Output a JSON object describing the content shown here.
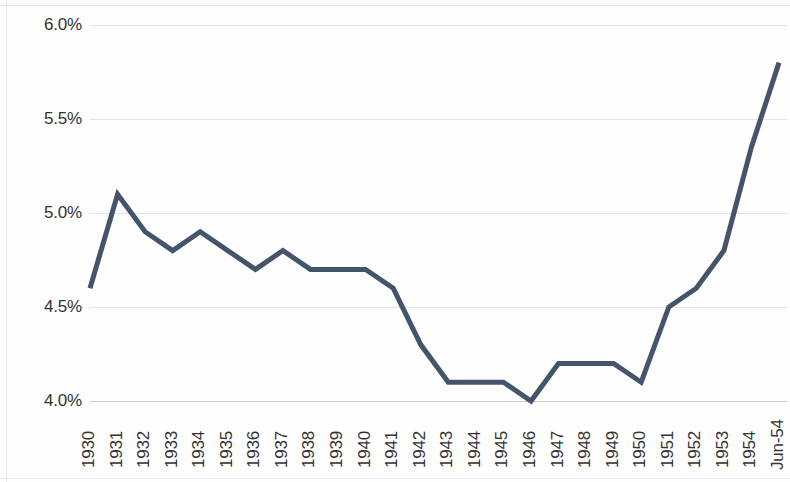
{
  "chart_data": {
    "type": "line",
    "title": "",
    "subtitle": "",
    "xlabel": "",
    "ylabel": "",
    "categories": [
      "1930",
      "1931",
      "1932",
      "1933",
      "1934",
      "1935",
      "1936",
      "1937",
      "1938",
      "1939",
      "1940",
      "1941",
      "1942",
      "1943",
      "1944",
      "1945",
      "1946",
      "1947",
      "1948",
      "1949",
      "1950",
      "1951",
      "1952",
      "1953",
      "1954",
      "Jun-54"
    ],
    "values": [
      4.6,
      5.1,
      4.9,
      4.8,
      4.9,
      4.8,
      4.7,
      4.8,
      4.7,
      4.7,
      4.7,
      4.6,
      4.3,
      4.1,
      4.1,
      4.1,
      4.0,
      4.2,
      4.2,
      4.2,
      4.1,
      4.5,
      4.6,
      4.8,
      5.35,
      5.8
    ],
    "series": [
      {
        "name": "",
        "values": [
          4.6,
          5.1,
          4.9,
          4.8,
          4.9,
          4.8,
          4.7,
          4.8,
          4.7,
          4.7,
          4.7,
          4.6,
          4.3,
          4.1,
          4.1,
          4.1,
          4.0,
          4.2,
          4.2,
          4.2,
          4.1,
          4.5,
          4.6,
          4.8,
          5.35,
          5.8
        ],
        "color": "#44546A"
      }
    ],
    "ylim": [
      4.0,
      6.0
    ],
    "ytick_values": [
      6.0,
      5.5,
      5.0,
      4.5,
      4.0
    ],
    "ytick_labels": [
      "6.0%",
      "5.5%",
      "5.0%",
      "4.5%",
      "4.0%"
    ],
    "value_unit": "%",
    "grid": true,
    "grid_axis": "y",
    "legend": false,
    "legend_position": "none",
    "marker": "none",
    "line_width": 5,
    "background_color": "#FEFEFE",
    "gridline_color": "#E3E3E3",
    "axis_color": "#C9C9C9",
    "tick_label_color": "#333333",
    "xtick_rotation": 90
  }
}
